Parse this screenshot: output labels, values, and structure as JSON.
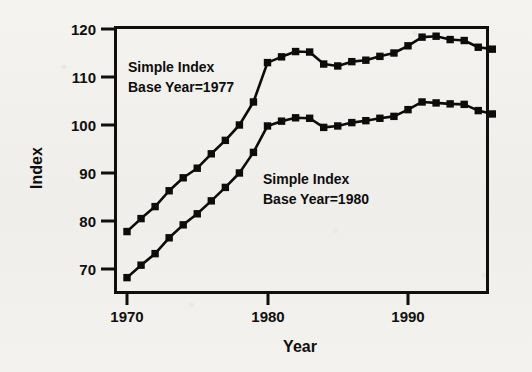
{
  "chart_data": {
    "type": "line",
    "title": "",
    "xlabel": "Year",
    "ylabel": "Index",
    "xlim": [
      1969.2,
      1996.6
    ],
    "ylim": [
      66.5,
      121.5
    ],
    "xticks": [
      1970,
      1980,
      1990
    ],
    "xticklabels": [
      "1970",
      "1980",
      "1990"
    ],
    "yticks": [
      70,
      80,
      90,
      100,
      110,
      120
    ],
    "yticklabels": [
      "70",
      "80",
      "90",
      "100",
      "110",
      "120"
    ],
    "grid": false,
    "legend": "none",
    "marker": "square",
    "line_color": "#0d0c0b",
    "x": [
      1970,
      1971,
      1972,
      1973,
      1974,
      1975,
      1976,
      1977,
      1978,
      1979,
      1980,
      1981,
      1982,
      1983,
      1984,
      1985,
      1986,
      1987,
      1988,
      1989,
      1990,
      1991,
      1992,
      1993,
      1994,
      1995,
      1996
    ],
    "series": [
      {
        "name": "Simple Index Base Year=1977",
        "values": [
          77.8,
          80.5,
          83.0,
          86.3,
          89.0,
          91.0,
          94.0,
          96.8,
          100.0,
          104.8,
          113.0,
          114.2,
          115.3,
          115.2,
          112.7,
          112.3,
          113.2,
          113.5,
          114.3,
          115.0,
          116.5,
          118.3,
          118.5,
          117.8,
          117.6,
          116.2,
          115.8
        ]
      },
      {
        "name": "Simple Index Base Year=1980",
        "values": [
          68.2,
          70.8,
          73.2,
          76.5,
          79.2,
          81.5,
          84.2,
          87.0,
          90.0,
          94.3,
          99.8,
          100.8,
          101.5,
          101.4,
          99.5,
          99.8,
          100.5,
          100.9,
          101.4,
          101.8,
          103.2,
          104.8,
          104.6,
          104.4,
          104.3,
          103.0,
          102.3
        ]
      }
    ],
    "annotations": [
      {
        "id": "annotation-upper",
        "line1": "Simple Index",
        "line2": "Base Year=1977",
        "x_px": 128,
        "y_px": 60
      },
      {
        "id": "annotation-lower",
        "line1": "Simple Index",
        "line2": "Base Year=1980",
        "x_px": 263,
        "y_px": 172
      }
    ]
  }
}
